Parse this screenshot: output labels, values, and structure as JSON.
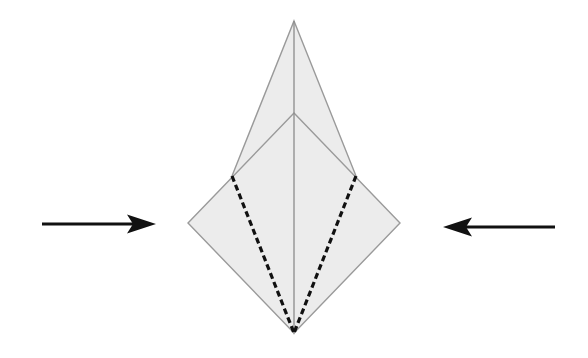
{
  "diagram": {
    "type": "origami-fold-step",
    "colors": {
      "background": "#ffffff",
      "paper_fill": "#ececec",
      "paper_edge": "#9a9a9a",
      "center_crease": "#8c8c8c",
      "fold_line": "#111111",
      "arrow": "#111111"
    },
    "shapes": {
      "back_kite": {
        "points": [
          [
            294,
            21
          ],
          [
            356,
            176
          ],
          [
            294,
            333
          ],
          [
            232,
            176
          ]
        ]
      },
      "front_diamond": {
        "points": [
          [
            294,
            113
          ],
          [
            400,
            223
          ],
          [
            294,
            333
          ],
          [
            188,
            223
          ]
        ]
      },
      "center_crease": {
        "from": [
          294,
          21
        ],
        "to": [
          294,
          333
        ]
      },
      "fold_lines": [
        {
          "side": "left",
          "from": [
            232,
            176
          ],
          "to": [
            294,
            333
          ]
        },
        {
          "side": "right",
          "from": [
            356,
            176
          ],
          "to": [
            294,
            333
          ]
        }
      ]
    },
    "arrows": [
      {
        "side": "left",
        "direction": "right",
        "tail": [
          42,
          224
        ],
        "tip": [
          156,
          224
        ]
      },
      {
        "side": "right",
        "direction": "left",
        "tail": [
          555,
          227
        ],
        "tip": [
          443,
          227
        ]
      }
    ]
  }
}
